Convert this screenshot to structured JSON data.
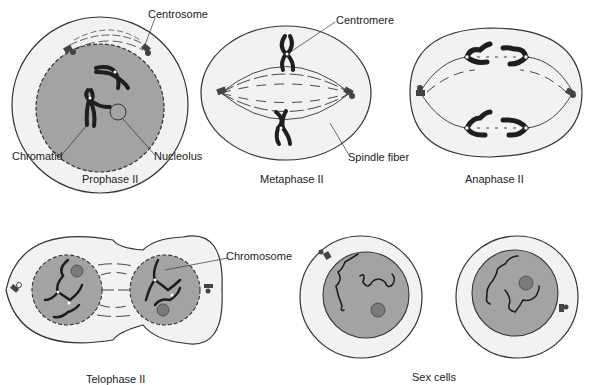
{
  "colors": {
    "cytoplasm": "#f2f2f2",
    "nucleus": "#a3a3a3",
    "outline": "#333333",
    "chromosome": "#1e1e1e",
    "nucleolus": "#7a7a7a",
    "background": "#ffffff"
  },
  "panels": [
    {
      "id": "prophase-ii",
      "caption": "Prophase II",
      "labels": [
        "Centrosome",
        "Chromatid",
        "Nucleolus"
      ]
    },
    {
      "id": "metaphase-ii",
      "caption": "Metaphase II",
      "labels": [
        "Centromere",
        "Spindle fiber"
      ]
    },
    {
      "id": "anaphase-ii",
      "caption": "Anaphase II",
      "labels": []
    },
    {
      "id": "telophase-ii",
      "caption": "Telophase II",
      "labels": [
        "Chromosome"
      ]
    },
    {
      "id": "sex-cells",
      "caption": "Sex cells",
      "labels": []
    }
  ]
}
